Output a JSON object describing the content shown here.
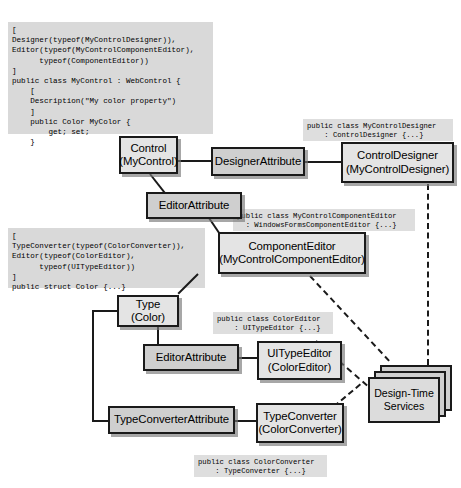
{
  "diagram": {
    "code_blocks": [
      {
        "id": "mycontrol-source",
        "text": "[\nDesigner(typeof(MyControlDesigner)),\nEditor(typeof(MyControlComponentEditor),\n      typeof(ComponentEditor))\n]\npublic class MyControl : WebControl {\n    [\n    Description(\"My color property\")\n    ]\n    public Color MyColor {\n        get; set;\n    }"
      },
      {
        "id": "color-source",
        "text": "[\nTypeConverter(typeof(ColorConverter)),\nEditor(typeof(ColorEditor),\n      typeof(UITypeEditor))\n]\npublic struct Color {...}"
      },
      {
        "id": "mycontroldesigner-source",
        "text": "public class MyControlDesigner\n    : ControlDesigner {...}"
      },
      {
        "id": "mycontrolcomponenteditor-source",
        "text": "public class MyControlComponentEditor\n  : WindowsFormsComponentEditor {...}"
      },
      {
        "id": "coloreditor-source",
        "text": "public class ColorEditor\n    : UITypeEditor {...}"
      },
      {
        "id": "colorconverter-source",
        "text": "public class ColorConverter\n    : TypeConverter {...}"
      }
    ],
    "nodes": [
      {
        "id": "control",
        "line1": "Control",
        "line2": "(MyControl)"
      },
      {
        "id": "designer-attribute",
        "line1": "DesignerAttribute",
        "line2": ""
      },
      {
        "id": "control-designer",
        "line1": "ControlDesigner",
        "line2": "(MyControlDesigner)"
      },
      {
        "id": "editor-attribute-top",
        "line1": "EditorAttribute",
        "line2": ""
      },
      {
        "id": "component-editor",
        "line1": "ComponentEditor",
        "line2": "(MyControlComponentEditor)"
      },
      {
        "id": "type-color",
        "line1": "Type",
        "line2": "(Color)"
      },
      {
        "id": "editor-attribute-bottom",
        "line1": "EditorAttribute",
        "line2": ""
      },
      {
        "id": "ui-type-editor",
        "line1": "UITypeEditor",
        "line2": "(ColorEditor)"
      },
      {
        "id": "type-converter-attribute",
        "line1": "TypeConverterAttribute",
        "line2": ""
      },
      {
        "id": "type-converter",
        "line1": "TypeConverter",
        "line2": "(ColorConverter)"
      },
      {
        "id": "design-time-services",
        "line1": "Design-Time",
        "line2": "Services"
      }
    ],
    "colors": {
      "box_fill": "#d7d7d7",
      "box_fill_light": "#e4e4e4",
      "code_fill": "#d9d9d9",
      "stroke": "#1a1a1a"
    }
  }
}
